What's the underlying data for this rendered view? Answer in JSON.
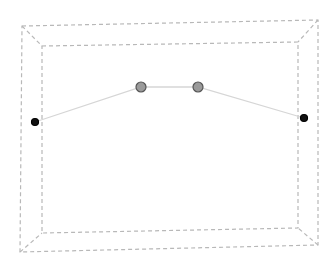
{
  "scene": {
    "background": "#ffffff",
    "frame_color": "#b8b8b8",
    "line_color": "#d6d6d6",
    "outer_frame": [
      [
        22,
        26
      ],
      [
        318,
        20
      ],
      [
        318,
        245
      ],
      [
        20,
        252
      ]
    ],
    "inner_frame": [
      [
        42,
        46
      ],
      [
        298,
        42
      ],
      [
        298,
        228
      ],
      [
        42,
        233
      ]
    ],
    "points": [
      {
        "id": "left-endpoint",
        "x": 35,
        "y": 122,
        "r": 3.5,
        "fill": "#111111",
        "stroke": "#000000"
      },
      {
        "id": "control-point-1",
        "x": 141,
        "y": 87,
        "r": 5,
        "fill": "#9a9a9a",
        "stroke": "#555555"
      },
      {
        "id": "control-point-2",
        "x": 198,
        "y": 87,
        "r": 5,
        "fill": "#9a9a9a",
        "stroke": "#555555"
      },
      {
        "id": "right-endpoint",
        "x": 304,
        "y": 118,
        "r": 3.5,
        "fill": "#111111",
        "stroke": "#000000"
      }
    ]
  }
}
